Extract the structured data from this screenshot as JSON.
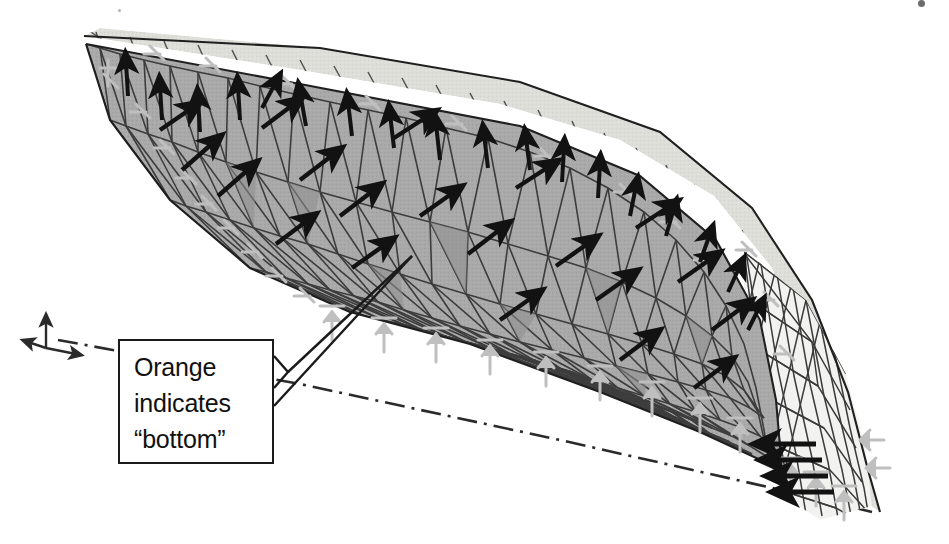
{
  "figure": {
    "kind": "fea-shell-model-screenshot",
    "title": "",
    "background_color": "#ffffff",
    "render_mode": "grayscale-scan"
  },
  "callout": {
    "text": "Orange\nindicates\n“bottom”",
    "line1": "Orange",
    "line2": "indicates",
    "line3": "“bottom”",
    "border_color": "#1a1a1a",
    "fill_color": "#ffffff",
    "text_color": "#111111",
    "leader_target_x": 412,
    "leader_target_y": 256
  },
  "model": {
    "mesh_name": "triangular-shell-mesh",
    "surface_bottom_label": "bottom-face",
    "surface_bottom_color": "#a9a9a9",
    "surface_top_color": "#dededa",
    "mesh_line_color": "#3b3b3b",
    "outline_color": "#1f1f1f",
    "load_arrow_color": "#121212",
    "support_symbol_color": "#bfbfbf",
    "axis_line_color": "#2b2b2b",
    "axis_line_style": "dash-dot"
  },
  "annotations": {
    "coordinate_triad": {
      "name": "coordinate-axis-triad",
      "x": 46,
      "y": 332,
      "vertical_axis_label": "",
      "horizontal_axis_label": ""
    },
    "scan_artifacts": [
      {
        "x": 921,
        "y": 2,
        "size": 7
      },
      {
        "x": 118,
        "y": 9,
        "size": 3
      }
    ]
  },
  "legend": {
    "items": [
      {
        "swatch": "#a9a9a9",
        "label": "bottom face (orange in original color model)"
      },
      {
        "swatch": "#dededa",
        "label": "top face"
      },
      {
        "swatch": "#121212",
        "label": "applied load arrows"
      },
      {
        "swatch": "#bfbfbf",
        "label": "boundary restraint symbols"
      }
    ]
  }
}
